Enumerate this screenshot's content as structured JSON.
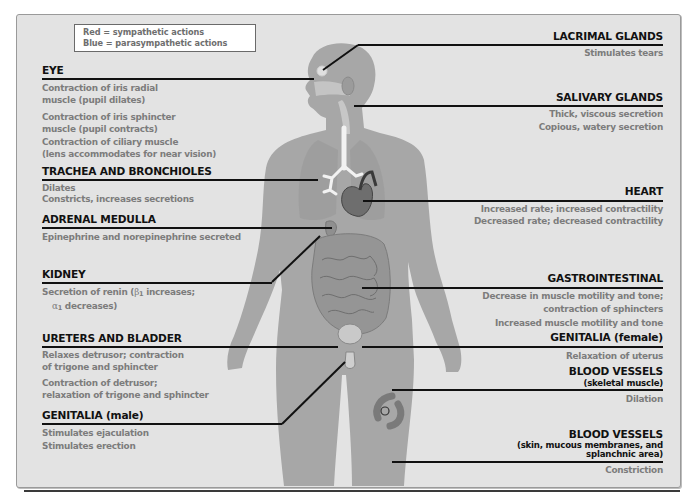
{
  "legend": {
    "line1": "Red = sympathetic actions",
    "line2": "Blue = parasympathetic actions"
  },
  "left": [
    {
      "id": "eye",
      "title": "EYE",
      "items": [
        "Contraction of iris radial",
        "muscle (pupil dilates)",
        "Contraction of iris sphincter",
        "muscle (pupil contracts)",
        "Contraction of ciliary muscle",
        "(lens accommodates for near vision)"
      ]
    },
    {
      "id": "trachea",
      "title": "TRACHEA AND BRONCHIOLES",
      "items": [
        "Dilates",
        "Constricts, increases secretions"
      ]
    },
    {
      "id": "adrenal",
      "title": "ADRENAL MEDULLA",
      "items": [
        "Epinephrine and norepinephrine secreted"
      ]
    },
    {
      "id": "kidney",
      "title": "KIDNEY",
      "items": [
        "Secretion of renin (",
        "β",
        "1",
        " increases;",
        "α",
        "1",
        " decreases)"
      ]
    },
    {
      "id": "ureters",
      "title": "URETERS AND BLADDER",
      "items": [
        "Relaxes detrusor; contraction",
        "of trigone and sphincter",
        "Contraction of detrusor;",
        "relaxation of trigone and sphincter"
      ]
    },
    {
      "id": "genitalia_male",
      "title": "GENITALIA (male)",
      "items": [
        "Stimulates ejaculation",
        "Stimulates erection"
      ]
    }
  ],
  "right": [
    {
      "id": "lacrimal",
      "title": "LACRIMAL GLANDS",
      "items": [
        "Stimulates tears"
      ]
    },
    {
      "id": "salivary",
      "title": "SALIVARY GLANDS",
      "items": [
        "Thick, viscous secretion",
        "Copious, watery secretion"
      ]
    },
    {
      "id": "heart",
      "title": "HEART",
      "items": [
        "Increased rate; increased contractility",
        "Decreased rate; decreased contractility"
      ]
    },
    {
      "id": "gi",
      "title": "GASTROINTESTINAL",
      "items": [
        "Decrease in muscle motility and tone;",
        "contraction of sphincters",
        "Increased muscle motility and tone"
      ]
    },
    {
      "id": "genitalia_female",
      "title": "GENITALIA (female)",
      "items": [
        "Relaxation of uterus"
      ]
    },
    {
      "id": "bv_skeletal",
      "title": "BLOOD VESSELS",
      "subtitle": "(skeletal muscle)",
      "items": [
        "Dilation"
      ]
    },
    {
      "id": "bv_skin",
      "title": "BLOOD VESSELS",
      "subtitle1": "(skin, mucous membranes, and",
      "subtitle2": "splanchnic area)",
      "items": [
        "Constriction"
      ]
    }
  ],
  "colors": {
    "panel_bg": "#e3e3e3",
    "body_fill": "#a9a9a9",
    "heading": "#111111",
    "action_text": "#7c7c7c"
  }
}
